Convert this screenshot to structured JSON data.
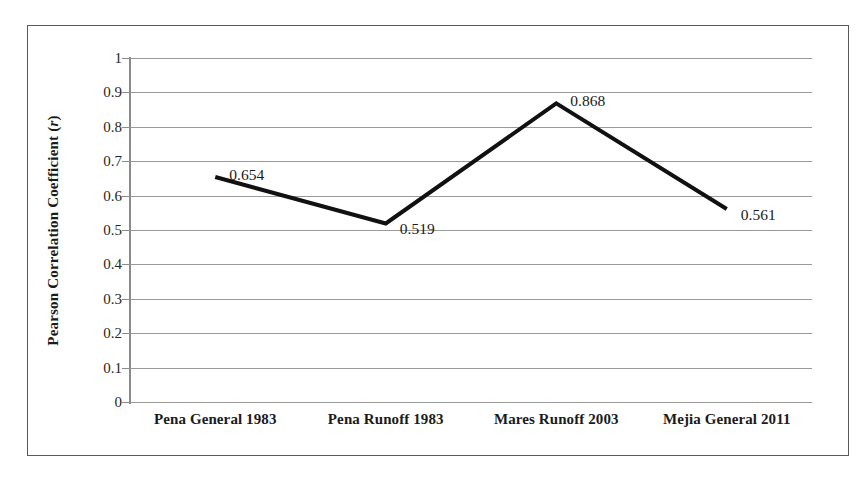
{
  "chart_data": {
    "type": "line",
    "title": "",
    "xlabel": "",
    "ylabel": "Pearson Correlation Coefficient (r)",
    "ylabel_plain": "Pearson Correlation Coefficient",
    "ylabel_symbol": "r",
    "categories": [
      "Pena General 1983",
      "Pena Runoff 1983",
      "Mares Runoff 2003",
      "Mejia General 2011"
    ],
    "values": [
      0.654,
      0.519,
      0.868,
      0.561
    ],
    "point_labels": [
      "0.654",
      "0.519",
      "0.868",
      "0.561"
    ],
    "ylim": [
      0,
      1
    ],
    "ytick_values": [
      1,
      0.9,
      0.8,
      0.7,
      0.6,
      0.5,
      0.4,
      0.3,
      0.2,
      0.1,
      0
    ],
    "ytick_labels": [
      "1",
      "0.9",
      "0.8",
      "0.7",
      "0.6",
      "0.5",
      "0.4",
      "0.3",
      "0.2",
      "0.1",
      "0"
    ],
    "grid": "horizontal",
    "legend": "none",
    "markers": "none",
    "series_color": "#111111",
    "gridline_color": "#9a9a9a",
    "axis_color": "#8a8a8a",
    "frame_color": "#5a5a5a",
    "background": "#ffffff",
    "line_width": 4
  }
}
